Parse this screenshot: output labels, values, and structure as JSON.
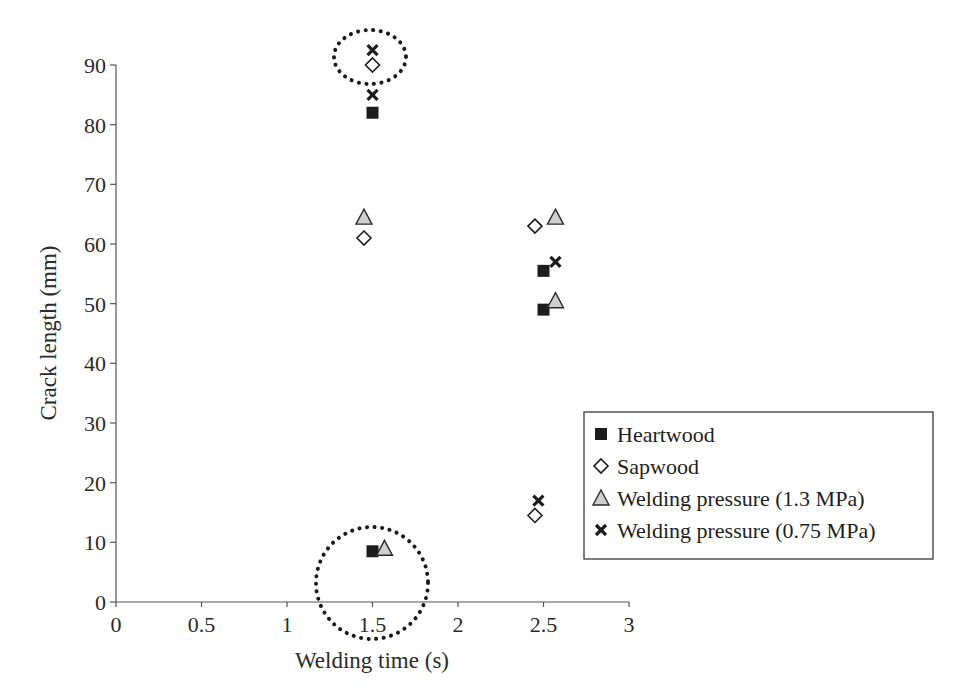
{
  "chart_data": {
    "type": "scatter",
    "title": "",
    "xlabel": "Welding time (s)",
    "ylabel": "Crack length (mm)",
    "xlim": [
      0,
      3
    ],
    "ylim": [
      0,
      90
    ],
    "xticks": [
      "0",
      "0.5",
      "1",
      "1.5",
      "2",
      "2.5",
      "3"
    ],
    "yticks": [
      "0",
      "10",
      "20",
      "30",
      "40",
      "50",
      "60",
      "70",
      "80",
      "90"
    ],
    "grid": false,
    "legend_position": "lower right (inside, boxed)",
    "series": [
      {
        "name": "Heartwood",
        "marker": "filled-square",
        "color": "#1a1a1a",
        "points": [
          [
            1.5,
            82
          ],
          [
            1.5,
            8.5
          ],
          [
            2.5,
            55.5
          ],
          [
            2.5,
            49
          ]
        ]
      },
      {
        "name": "Sapwood",
        "marker": "open-diamond",
        "color": "#1a1a1a",
        "points": [
          [
            1.5,
            90
          ],
          [
            1.45,
            61
          ],
          [
            2.45,
            63
          ],
          [
            2.45,
            14.5
          ]
        ]
      },
      {
        "name": "Welding pressure (1.3 MPa)",
        "marker": "gray-triangle",
        "color": "#c8c8c8",
        "points": [
          [
            1.45,
            64.5
          ],
          [
            1.57,
            9
          ],
          [
            2.57,
            64.5
          ],
          [
            2.57,
            50.5
          ]
        ]
      },
      {
        "name": "Welding pressure (0.75 MPa)",
        "marker": "x",
        "color": "#1a1a1a",
        "points": [
          [
            1.5,
            92.5
          ],
          [
            1.5,
            85
          ],
          [
            2.57,
            57
          ],
          [
            2.47,
            17
          ]
        ]
      }
    ],
    "annotations": [
      {
        "type": "dotted-ellipse",
        "around": "points near x=1.5, y≈90-92"
      },
      {
        "type": "dotted-circle",
        "around": "points near x=1.5, y≈8-9"
      }
    ]
  },
  "legend": {
    "items": [
      {
        "label": "Heartwood",
        "marker": "filled-square"
      },
      {
        "label": "Sapwood",
        "marker": "open-diamond"
      },
      {
        "label": "Welding pressure (1.3 MPa)",
        "marker": "gray-triangle"
      },
      {
        "label": "Welding pressure (0.75 MPa)",
        "marker": "x"
      }
    ]
  }
}
